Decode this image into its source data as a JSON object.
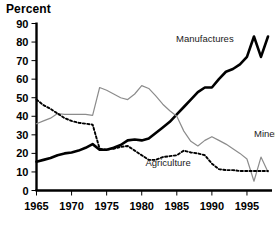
{
  "chart_data": {
    "type": "line",
    "title": "",
    "ylabel": "Percent",
    "xlabel": "",
    "ylim": [
      0,
      90
    ],
    "xlim": [
      1965,
      1998
    ],
    "yticks": [
      0,
      10,
      20,
      30,
      40,
      50,
      60,
      70,
      80,
      90
    ],
    "xticks": [
      1965,
      1970,
      1975,
      1980,
      1985,
      1990,
      1995
    ],
    "xtick_labels": [
      "1965",
      "1970",
      "1975",
      "1980",
      "1985",
      "1990",
      "1995"
    ],
    "ytick_labels": [
      "0",
      "10",
      "20",
      "30",
      "40",
      "50",
      "60",
      "70",
      "80",
      "90"
    ],
    "grid": false,
    "legend_position": "inline-annotations",
    "x": [
      1965,
      1966,
      1967,
      1968,
      1969,
      1970,
      1971,
      1972,
      1973,
      1974,
      1975,
      1976,
      1977,
      1978,
      1979,
      1980,
      1981,
      1982,
      1983,
      1984,
      1985,
      1986,
      1987,
      1988,
      1989,
      1990,
      1991,
      1992,
      1993,
      1994,
      1995,
      1996,
      1997,
      1998
    ],
    "series": [
      {
        "name": "Manufactures",
        "style": "solid-thick-black",
        "color": "#000000",
        "label_x": 1989,
        "label_y": 80,
        "values": [
          15.5,
          16.5,
          17.5,
          19.0,
          20.0,
          20.5,
          21.5,
          23.0,
          25.0,
          22.0,
          22.0,
          23.0,
          24.5,
          27.0,
          27.5,
          27.0,
          28.0,
          31.0,
          34.0,
          37.0,
          41.0,
          45.0,
          49.0,
          53.0,
          55.5,
          55.5,
          60.0,
          64.0,
          65.5,
          68.0,
          72.0,
          83.0,
          72.0,
          83.0
        ]
      },
      {
        "name": "Minerals",
        "style": "solid-thin-gray",
        "color": "#8c8c8c",
        "label_x": 1996,
        "label_y": 29,
        "values": [
          36.0,
          37.5,
          39.0,
          41.5,
          41.0,
          41.0,
          41.0,
          41.0,
          40.5,
          55.5,
          54.0,
          52.0,
          50.0,
          49.0,
          52.0,
          56.5,
          55.0,
          51.0,
          46.5,
          43.0,
          40.0,
          32.0,
          26.5,
          24.0,
          27.0,
          29.0,
          27.0,
          25.0,
          22.5,
          20.0,
          17.0,
          5.0,
          18.0,
          10.0
        ]
      },
      {
        "name": "Agriculture",
        "style": "dotted-black",
        "color": "#000000",
        "label_x": 1987,
        "label_y": 13,
        "values": [
          49.0,
          46.0,
          44.0,
          41.5,
          39.0,
          37.5,
          36.5,
          36.0,
          35.5,
          22.5,
          22.0,
          22.5,
          23.5,
          24.0,
          21.5,
          19.0,
          16.5,
          16.5,
          18.0,
          18.5,
          19.0,
          21.5,
          20.5,
          20.0,
          19.0,
          14.5,
          11.5,
          11.0,
          11.0,
          10.5,
          10.5,
          10.5,
          10.5,
          10.5
        ]
      }
    ]
  }
}
